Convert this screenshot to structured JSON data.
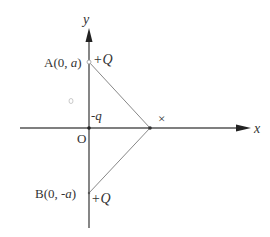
{
  "diagram": {
    "type": "coordinate-charge-diagram",
    "axes": {
      "x_label": "x",
      "y_label": "y",
      "origin_label": "O"
    },
    "points": {
      "A": {
        "label_prefix": "A(0, ",
        "label_var": "a",
        "label_suffix": ")",
        "charge": "+Q"
      },
      "B": {
        "label_prefix": "B(0, -",
        "label_var": "a",
        "label_suffix": ")",
        "charge": "+Q"
      },
      "origin_charge": "-q"
    },
    "marks": {
      "cross": "×"
    },
    "colors": {
      "axis": "#333333",
      "line": "#777777",
      "text": "#333333"
    }
  }
}
